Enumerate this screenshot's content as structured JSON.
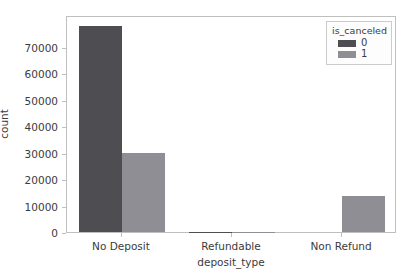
{
  "chart_data": {
    "type": "bar",
    "title": "",
    "xlabel": "deposit_type",
    "ylabel": "count",
    "categories": [
      "No Deposit",
      "Refundable",
      "Non Refund"
    ],
    "legend_title": "is_canceled",
    "legend_position": "upper right",
    "grid": false,
    "ylim": [
      0,
      82000
    ],
    "yticks": [
      0,
      10000,
      20000,
      30000,
      40000,
      50000,
      60000,
      70000
    ],
    "ytick_labels": [
      "0",
      "10000",
      "20000",
      "30000",
      "40000",
      "50000",
      "60000",
      "70000"
    ],
    "series": [
      {
        "name": "0",
        "color": "#4d4d52",
        "values": [
          78000,
          100,
          0
        ]
      },
      {
        "name": "1",
        "color": "#8e8e94",
        "values": [
          29700,
          60,
          13500
        ]
      }
    ]
  },
  "axes": {
    "frame_color": "#bfbfbf",
    "background": "#ffffff"
  }
}
